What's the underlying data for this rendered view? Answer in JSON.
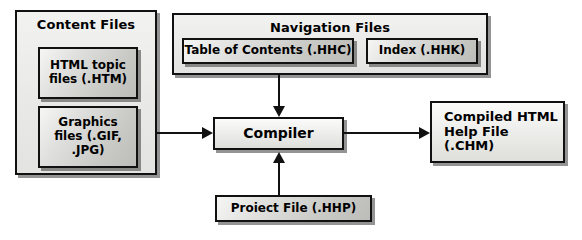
{
  "diagram": {
    "colors": {
      "background": "#ffffff",
      "stroke": "#111111",
      "panel_fill": "#ebebe9",
      "item_fill": "#cfcfcc",
      "process_fill": "#efefed",
      "shadow": "#3c3c3c"
    },
    "panels": [
      {
        "id": "content-files",
        "title": "Content Files",
        "items": [
          {
            "id": "html-topic-files",
            "label": "HTML topic\nfiles (.HTM)"
          },
          {
            "id": "graphics-files",
            "label": "Graphics\nfiles (.GIF,\n.JPG)"
          }
        ]
      },
      {
        "id": "navigation-files",
        "title": "Navigation Files",
        "items": [
          {
            "id": "table-of-contents",
            "label": "Table of Contents (.HHC)"
          },
          {
            "id": "index",
            "label": "Index (.HHK)"
          }
        ]
      }
    ],
    "nodes": {
      "compiler": {
        "id": "compiler",
        "label": "Compiler"
      },
      "output": {
        "id": "compiled-help-file",
        "label": "Compiled HTML\nHelp File (.CHM)"
      },
      "project": {
        "id": "project-file",
        "label": "Proiect File (.HHP)"
      }
    },
    "connectors": [
      {
        "id": "content-to-compiler",
        "from": "content-files",
        "to": "compiler",
        "direction": "right"
      },
      {
        "id": "navigation-to-compiler",
        "from": "navigation-files",
        "to": "compiler",
        "direction": "down"
      },
      {
        "id": "project-to-compiler",
        "from": "project-file",
        "to": "compiler",
        "direction": "up"
      },
      {
        "id": "compiler-to-output",
        "from": "compiler",
        "to": "compiled-help-file",
        "direction": "right"
      }
    ]
  }
}
